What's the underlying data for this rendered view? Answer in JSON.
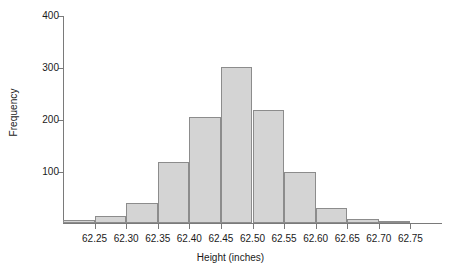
{
  "chart_data": {
    "type": "bar",
    "title": "",
    "xlabel": "Height (inches)",
    "ylabel": "Frequency",
    "grid": false,
    "legend": null,
    "xlim": [
      62.2,
      62.8
    ],
    "ylim": [
      0,
      400
    ],
    "bin_width": 0.05,
    "xticks": [
      62.25,
      62.3,
      62.35,
      62.4,
      62.45,
      62.5,
      62.55,
      62.6,
      62.65,
      62.7,
      62.75
    ],
    "xtick_labels": [
      "62.25",
      "62.30",
      "62.35",
      "62.40",
      "62.45",
      "62.50",
      "62.55",
      "62.60",
      "62.65",
      "62.70",
      "62.75"
    ],
    "yticks": [
      100,
      200,
      300,
      400
    ],
    "ytick_labels": [
      "100",
      "200",
      "300",
      "400"
    ],
    "bin_edges": [
      62.2,
      62.25,
      62.3,
      62.35,
      62.4,
      62.45,
      62.5,
      62.55,
      62.6,
      62.65,
      62.7,
      62.75,
      62.8
    ],
    "categories": [
      "62.20-62.25",
      "62.25-62.30",
      "62.30-62.35",
      "62.35-62.40",
      "62.40-62.45",
      "62.45-62.50",
      "62.50-62.55",
      "62.55-62.60",
      "62.60-62.65",
      "62.65-62.70",
      "62.70-62.75",
      "62.75-62.80"
    ],
    "values": [
      5,
      13,
      38,
      118,
      203,
      300,
      218,
      98,
      28,
      8,
      3,
      0
    ],
    "bar_fill_color": "#d4d4d4",
    "bar_edge_color": "#8c8c8c",
    "axis_color": "#7a7a7a"
  }
}
